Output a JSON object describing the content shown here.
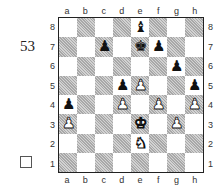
{
  "puzzle_number": "53",
  "checkbox": {
    "checked": false
  },
  "board": {
    "files": [
      "a",
      "b",
      "c",
      "d",
      "e",
      "f",
      "g",
      "h"
    ],
    "ranks": [
      "8",
      "7",
      "6",
      "5",
      "4",
      "3",
      "2",
      "1"
    ],
    "pieces": {
      "e8": {
        "color": "black",
        "type": "bishop",
        "glyph": "♝"
      },
      "c7": {
        "color": "black",
        "type": "pawn",
        "glyph": "♟"
      },
      "e7": {
        "color": "black",
        "type": "king",
        "glyph": "♚"
      },
      "f7": {
        "color": "black",
        "type": "pawn",
        "glyph": "♟"
      },
      "g6": {
        "color": "black",
        "type": "pawn",
        "glyph": "♟"
      },
      "d5": {
        "color": "black",
        "type": "pawn",
        "glyph": "♟"
      },
      "e5": {
        "color": "white",
        "type": "pawn",
        "glyph": "♟"
      },
      "h5": {
        "color": "black",
        "type": "pawn",
        "glyph": "♟"
      },
      "a4": {
        "color": "black",
        "type": "pawn",
        "glyph": "♟"
      },
      "d4": {
        "color": "white",
        "type": "pawn",
        "glyph": "♟"
      },
      "f4": {
        "color": "white",
        "type": "pawn",
        "glyph": "♟"
      },
      "h4": {
        "color": "white",
        "type": "pawn",
        "glyph": "♟"
      },
      "a3": {
        "color": "white",
        "type": "pawn",
        "glyph": "♟"
      },
      "e3": {
        "color": "white",
        "type": "king",
        "glyph": "♚"
      },
      "g3": {
        "color": "white",
        "type": "pawn",
        "glyph": "♟"
      },
      "e2": {
        "color": "white",
        "type": "knight",
        "glyph": "♞"
      }
    }
  }
}
